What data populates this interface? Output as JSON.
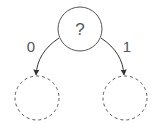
{
  "diagram": {
    "type": "binary-decision-tree",
    "colors": {
      "stroke": "#555555",
      "background": "#ffffff"
    },
    "root": {
      "label": "?",
      "style": "solid"
    },
    "children": [
      {
        "edge_label": "0",
        "style": "dashed",
        "label": ""
      },
      {
        "edge_label": "1",
        "style": "dashed",
        "label": ""
      }
    ]
  }
}
